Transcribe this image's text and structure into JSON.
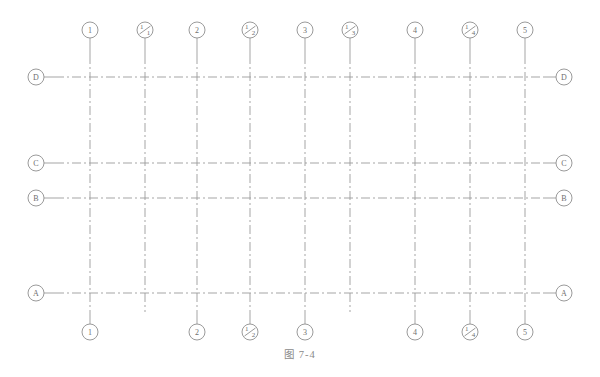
{
  "figure": {
    "caption": "图 7-4",
    "line_color": "#9b9b9b",
    "bubble_stroke": "#8e8e8e",
    "text_color": "#6f6f6f",
    "background": "#ffffff",
    "width": 600,
    "height": 377
  },
  "grid": {
    "line_style": "dash-dot",
    "vertical_axes": [
      {
        "id": "v1",
        "label_top": "1",
        "label_bottom": "1",
        "x": 90,
        "fraction": false
      },
      {
        "id": "v2",
        "label_top": "1/1",
        "label_bottom": "",
        "x": 145,
        "fraction": true
      },
      {
        "id": "v3",
        "label_top": "2",
        "label_bottom": "2",
        "x": 197,
        "fraction": false
      },
      {
        "id": "v4",
        "label_top": "1/2",
        "label_bottom": "1/2",
        "x": 250,
        "fraction": true
      },
      {
        "id": "v5",
        "label_top": "3",
        "label_bottom": "3",
        "x": 305,
        "fraction": false
      },
      {
        "id": "v6",
        "label_top": "1/3",
        "label_bottom": "",
        "x": 350,
        "fraction": true
      },
      {
        "id": "v7",
        "label_top": "4",
        "label_bottom": "4",
        "x": 415,
        "fraction": false
      },
      {
        "id": "v8",
        "label_top": "1/4",
        "label_bottom": "1/4",
        "x": 470,
        "fraction": true
      },
      {
        "id": "v9",
        "label_top": "5",
        "label_bottom": "5",
        "x": 525,
        "fraction": false
      }
    ],
    "horizontal_axes": [
      {
        "id": "hD",
        "label_left": "D",
        "label_right": "D",
        "y": 77
      },
      {
        "id": "hC",
        "label_left": "C",
        "label_right": "C",
        "y": 163
      },
      {
        "id": "hB",
        "label_left": "B",
        "label_right": "B",
        "y": 198
      },
      {
        "id": "hA",
        "label_left": "A",
        "label_right": "A",
        "y": 293
      }
    ],
    "extent": {
      "x_start": 55,
      "x_end": 545,
      "y_start": 55,
      "y_end": 312
    },
    "bubble": {
      "radius": 8,
      "top_row_y": 30,
      "bottom_row_y": 332,
      "left_col_x": 36,
      "right_col_x": 564,
      "leader_length": 20
    }
  }
}
